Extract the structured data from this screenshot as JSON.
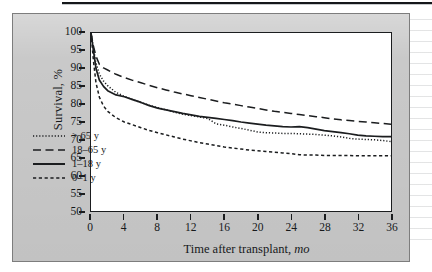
{
  "figure": {
    "panel_bg": "#c9c9c9",
    "plot_bg": "#ffffff",
    "ink": "#1b1d1f"
  },
  "chart_data": {
    "type": "line",
    "title": "",
    "xlabel": "Time after transplant,",
    "xlabel_unit": "mo",
    "ylabel": "Survival, %",
    "xlim": [
      0,
      36
    ],
    "ylim": [
      50,
      100
    ],
    "xticks": [
      0,
      4,
      8,
      12,
      16,
      20,
      24,
      28,
      32,
      36
    ],
    "yticks": [
      50,
      55,
      60,
      65,
      70,
      75,
      80,
      85,
      90,
      95,
      100
    ],
    "grid": false,
    "legend_position": "lower-left-inside",
    "series": [
      {
        "name": "> 65 y",
        "style": "dotted",
        "color": "#1b1d1f",
        "x": [
          0,
          0.3,
          0.6,
          1,
          1.5,
          2,
          3,
          4,
          5,
          6,
          7,
          8,
          9,
          10,
          11,
          12,
          13,
          14,
          15,
          16,
          17,
          18,
          19,
          20,
          21,
          22,
          23,
          24,
          25,
          26,
          27,
          28,
          29,
          30,
          31,
          32,
          33,
          34,
          35,
          36
        ],
        "y": [
          100,
          95.5,
          91.5,
          88.5,
          86.5,
          85.2,
          83.3,
          82.2,
          81.3,
          80.5,
          79.7,
          79.0,
          78.4,
          77.8,
          77.2,
          76.8,
          76.4,
          76.0,
          74.5,
          74.1,
          73.6,
          73.2,
          72.7,
          72.2,
          72.0,
          71.9,
          71.8,
          71.8,
          71.7,
          71.6,
          71.5,
          71.3,
          71.1,
          70.8,
          70.4,
          70.2,
          70.1,
          70.0,
          69.8,
          69.5
        ]
      },
      {
        "name": "18–65 y",
        "style": "long-dash",
        "color": "#1b1d1f",
        "x": [
          0,
          0.3,
          0.6,
          1,
          1.5,
          2,
          3,
          4,
          5,
          6,
          7,
          8,
          9,
          10,
          11,
          12,
          13,
          14,
          15,
          16,
          17,
          18,
          19,
          20,
          21,
          22,
          23,
          24,
          25,
          26,
          27,
          28,
          29,
          30,
          31,
          32,
          33,
          34,
          35,
          36
        ],
        "y": [
          100,
          96.2,
          93.5,
          91.2,
          90.2,
          89.6,
          88.4,
          87.5,
          86.7,
          86.0,
          85.3,
          84.6,
          84.0,
          83.4,
          82.9,
          82.4,
          81.9,
          81.4,
          80.9,
          80.4,
          80.0,
          79.6,
          79.2,
          78.8,
          78.4,
          78.0,
          77.7,
          77.4,
          77.1,
          76.8,
          76.5,
          76.2,
          75.9,
          75.6,
          75.4,
          75.2,
          75.0,
          74.8,
          74.6,
          74.4
        ]
      },
      {
        "name": "1–18 y",
        "style": "solid",
        "color": "#1b1d1f",
        "x": [
          0,
          0.3,
          0.6,
          1,
          1.5,
          2,
          3,
          4,
          5,
          6,
          7,
          8,
          9,
          10,
          11,
          12,
          13,
          14,
          15,
          16,
          17,
          18,
          19,
          20,
          21,
          22,
          23,
          24,
          25,
          26,
          27,
          28,
          29,
          30,
          31,
          32,
          33,
          34,
          35,
          36
        ],
        "y": [
          100,
          95.0,
          90.0,
          86.8,
          85.0,
          83.8,
          82.6,
          82.1,
          81.3,
          80.5,
          79.6,
          78.9,
          78.4,
          77.9,
          77.4,
          77.0,
          76.6,
          76.3,
          76.0,
          75.7,
          75.4,
          75.0,
          74.7,
          74.4,
          74.1,
          73.9,
          73.7,
          73.6,
          73.7,
          73.4,
          73.0,
          72.6,
          72.3,
          72.0,
          71.7,
          71.3,
          71.1,
          71.0,
          70.9,
          70.9
        ]
      },
      {
        "name": "0–1 y",
        "style": "short-dash",
        "color": "#1b1d1f",
        "x": [
          0,
          0.3,
          0.6,
          1,
          1.5,
          2,
          3,
          4,
          5,
          6,
          7,
          8,
          9,
          10,
          11,
          12,
          13,
          14,
          15,
          16,
          17,
          18,
          19,
          20,
          21,
          22,
          23,
          24,
          25,
          26,
          27,
          28,
          29,
          30,
          31,
          32,
          33,
          34,
          35,
          36
        ],
        "y": [
          100,
          92.0,
          86.0,
          82.0,
          79.5,
          78.0,
          76.2,
          75.0,
          74.2,
          73.4,
          72.6,
          72.0,
          71.4,
          70.8,
          70.2,
          69.7,
          69.2,
          68.8,
          68.4,
          68.0,
          67.7,
          67.4,
          67.1,
          66.9,
          66.7,
          66.5,
          66.3,
          66.1,
          65.8,
          65.7,
          65.7,
          65.6,
          65.6,
          65.6,
          65.6,
          65.5,
          65.5,
          65.5,
          65.5,
          65.5
        ]
      }
    ]
  },
  "legend": {
    "items": [
      {
        "label": "> 65 y",
        "style": "dotted"
      },
      {
        "label": "18–65 y",
        "style": "long-dash"
      },
      {
        "label": "1–18 y",
        "style": "solid"
      },
      {
        "label": "0–1 y",
        "style": "short-dash"
      }
    ]
  }
}
